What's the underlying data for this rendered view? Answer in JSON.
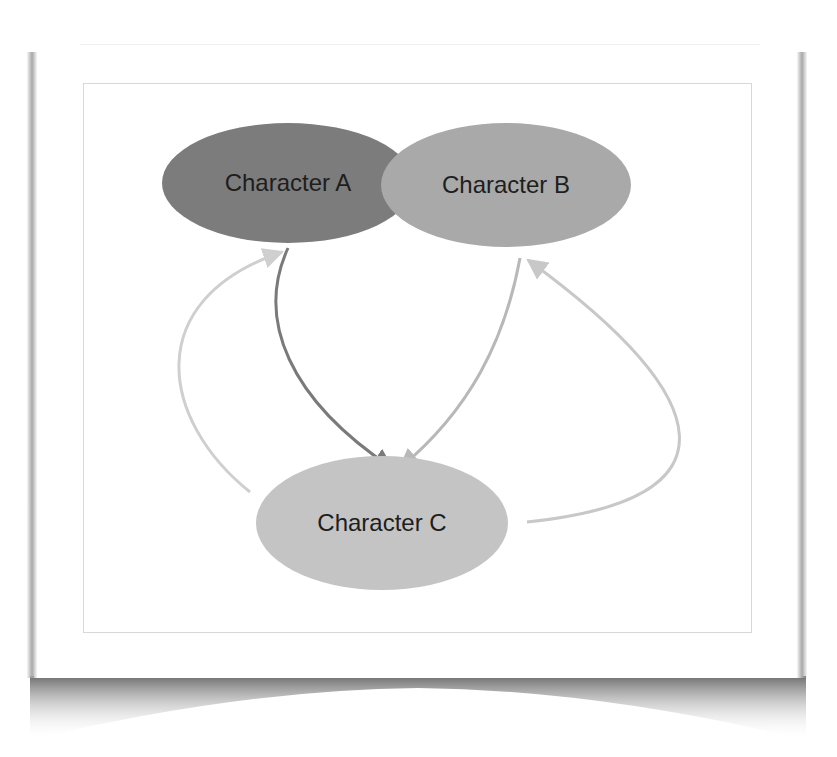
{
  "diagram": {
    "nodes": [
      {
        "id": "A",
        "label": "Character A",
        "fill": "#7c7c7c"
      },
      {
        "id": "B",
        "label": "Character B",
        "fill": "#a9a9a9"
      },
      {
        "id": "C",
        "label": "Character C",
        "fill": "#c4c4c4"
      }
    ],
    "edges": [
      {
        "from": "A",
        "to": "C",
        "color": "#7a7a7a"
      },
      {
        "from": "B",
        "to": "C",
        "color": "#b8b8b8"
      },
      {
        "from": "C",
        "to": "A",
        "color": "#cfcfcf"
      },
      {
        "from": "C",
        "to": "B",
        "color": "#c8c8c8"
      }
    ]
  }
}
